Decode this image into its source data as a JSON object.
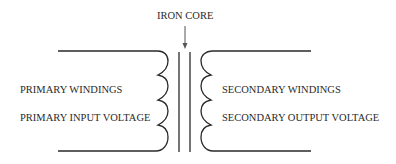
{
  "diagram": {
    "core_label": "IRON CORE",
    "primary": {
      "windings_label": "PRIMARY WINDINGS",
      "voltage_label": "PRIMARY INPUT VOLTAGE",
      "turns": 4
    },
    "secondary": {
      "windings_label": "SECONDARY WINDINGS",
      "voltage_label": "SECONDARY OUTPUT VOLTAGE",
      "turns": 4
    },
    "colors": {
      "line": "#2a2a2a",
      "background": "#ffffff"
    }
  }
}
